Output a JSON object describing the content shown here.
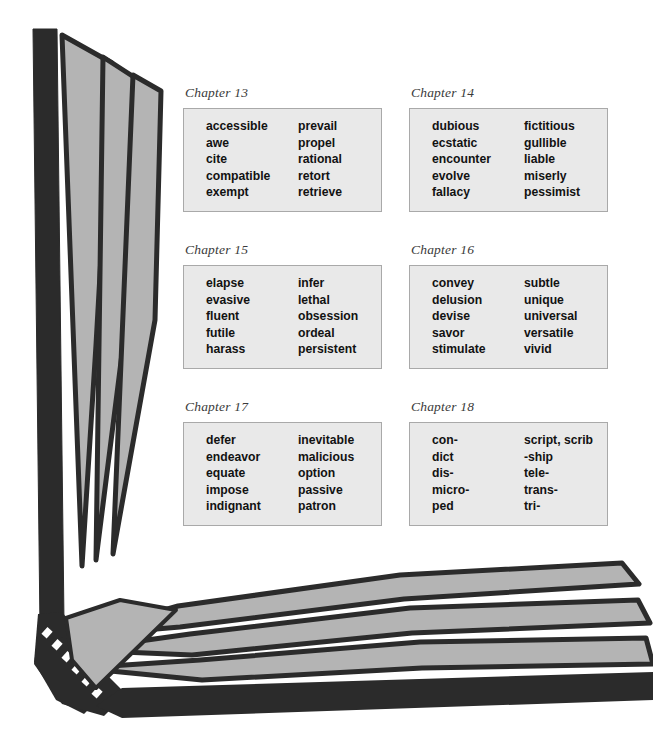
{
  "figure": {
    "kind": "open-book-illustration",
    "colors": {
      "page_fill": "#b4b4b4",
      "page_outline": "#2b2b2b",
      "cover_dark": "#2b2b2b",
      "background": "#ffffff",
      "box_fill": "#e9e9e9",
      "box_border": "#a9a9a9",
      "label_color": "#3a3a3a",
      "word_color": "#121212"
    }
  },
  "chapters": [
    {
      "label": "Chapter 13",
      "left_column": [
        "accessible",
        "awe",
        "cite",
        "compatible",
        "exempt"
      ],
      "right_column": [
        "prevail",
        "propel",
        "rational",
        "retort",
        "retrieve"
      ]
    },
    {
      "label": "Chapter 14",
      "left_column": [
        "dubious",
        "ecstatic",
        "encounter",
        "evolve",
        "fallacy"
      ],
      "right_column": [
        "fictitious",
        "gullible",
        "liable",
        "miserly",
        "pessimist"
      ]
    },
    {
      "label": "Chapter 15",
      "left_column": [
        "elapse",
        "evasive",
        "fluent",
        "futile",
        "harass"
      ],
      "right_column": [
        "infer",
        "lethal",
        "obsession",
        "ordeal",
        "persistent"
      ]
    },
    {
      "label": "Chapter 16",
      "left_column": [
        "convey",
        "delusion",
        "devise",
        "savor",
        "stimulate"
      ],
      "right_column": [
        "subtle",
        "unique",
        "universal",
        "versatile",
        "vivid"
      ]
    },
    {
      "label": "Chapter 17",
      "left_column": [
        "defer",
        "endeavor",
        "equate",
        "impose",
        "indignant"
      ],
      "right_column": [
        "inevitable",
        "malicious",
        "option",
        "passive",
        "patron"
      ]
    },
    {
      "label": "Chapter 18",
      "left_column": [
        "con-",
        "dict",
        "dis-",
        "micro-",
        "ped"
      ],
      "right_column": [
        "script, scrib",
        "-ship",
        "tele-",
        "trans-",
        "tri-"
      ]
    }
  ]
}
